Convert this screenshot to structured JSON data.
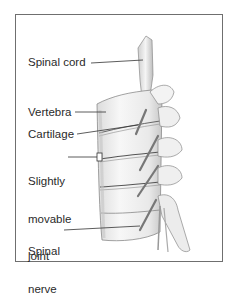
{
  "diagram": {
    "labels": [
      {
        "id": "spinal-cord",
        "lines": [
          "Spinal cord"
        ]
      },
      {
        "id": "vertebra",
        "lines": [
          "Vertebra"
        ]
      },
      {
        "id": "cartilage",
        "lines": [
          "Cartilage"
        ]
      },
      {
        "id": "slightly-movable-joint",
        "lines": [
          "Slightly",
          "movable",
          "joint"
        ]
      },
      {
        "id": "spinal-nerve",
        "lines": [
          "Spinal",
          "nerve"
        ]
      }
    ],
    "colors": {
      "frame": "#6f6f6f",
      "text": "#2a2a2a",
      "leader_line": "#333333",
      "bone_fill": "#f4f4f4",
      "bone_shade": "#b9b9b9",
      "bone_outline": "#8a8a8a"
    }
  }
}
